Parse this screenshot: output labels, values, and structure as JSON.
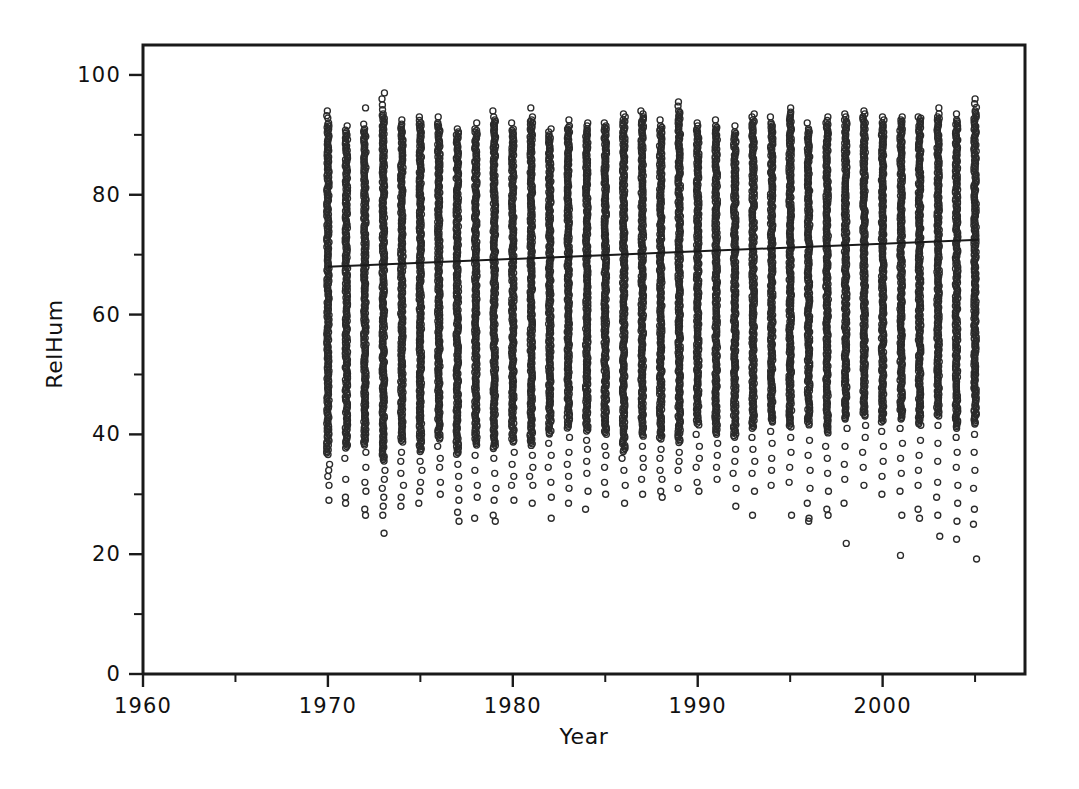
{
  "chart_data": {
    "type": "scatter",
    "title": "",
    "xlabel": "Year",
    "ylabel": "RelHum",
    "xlim": [
      1960,
      2007.7
    ],
    "ylim": [
      0,
      105
    ],
    "grid": false,
    "legend": "none",
    "x_ticks_major": [
      1960,
      1970,
      1980,
      1990,
      2000
    ],
    "x_tick_labels": [
      "1960",
      "1970",
      "1980",
      "1990",
      "2000"
    ],
    "x_ticks_minor": [
      1965,
      1975,
      1985,
      1995,
      2005
    ],
    "y_ticks_major": [
      0,
      20,
      40,
      60,
      80,
      100
    ],
    "y_tick_labels": [
      "0",
      "20",
      "40",
      "60",
      "80",
      "100"
    ],
    "y_ticks_minor": [
      10,
      30,
      50,
      70,
      90
    ],
    "marker_style": "open-circle",
    "marker_size_px": 6,
    "series": [
      {
        "name": "RelHum observations",
        "note": "Dense daily relative-humidity readings, one vertical column of points per year.",
        "columns": [
          {
            "x": 1970.0,
            "dense_min": 36.5,
            "dense_max": 92.0,
            "top_outliers": [
              94.0,
              93.2,
              92.8
            ],
            "bottom_outliers": [
              35.0,
              34.0,
              33.0,
              31.5,
              29.0
            ]
          },
          {
            "x": 1971.0,
            "dense_min": 37.5,
            "dense_max": 90.5,
            "top_outliers": [
              91.5,
              90.8
            ],
            "bottom_outliers": [
              36.0,
              32.5,
              29.5,
              28.5
            ]
          },
          {
            "x": 1972.0,
            "dense_min": 38.0,
            "dense_max": 91.0,
            "top_outliers": [
              94.5,
              91.8
            ],
            "bottom_outliers": [
              37.0,
              34.5,
              32.0,
              30.5,
              27.5,
              26.5
            ]
          },
          {
            "x": 1973.0,
            "dense_min": 35.5,
            "dense_max": 93.5,
            "top_outliers": [
              97.0,
              96.0,
              95.0,
              94.2
            ],
            "bottom_outliers": [
              34.0,
              32.5,
              31.0,
              29.5,
              28.0,
              26.5,
              23.5
            ]
          },
          {
            "x": 1974.0,
            "dense_min": 38.5,
            "dense_max": 91.5,
            "top_outliers": [
              92.5,
              91.8
            ],
            "bottom_outliers": [
              37.0,
              35.5,
              33.5,
              31.5,
              29.5,
              28.0
            ]
          },
          {
            "x": 1975.0,
            "dense_min": 37.0,
            "dense_max": 92.0,
            "top_outliers": [
              93.0,
              92.4
            ],
            "bottom_outliers": [
              35.5,
              34.0,
              32.0,
              30.5,
              28.5
            ]
          },
          {
            "x": 1976.0,
            "dense_min": 39.0,
            "dense_max": 92.0,
            "top_outliers": [
              93.0
            ],
            "bottom_outliers": [
              38.0,
              36.0,
              34.5,
              32.0,
              30.0
            ]
          },
          {
            "x": 1977.0,
            "dense_min": 36.5,
            "dense_max": 90.5,
            "top_outliers": [
              91.0
            ],
            "bottom_outliers": [
              35.0,
              33.0,
              31.0,
              29.0,
              27.0,
              25.5
            ]
          },
          {
            "x": 1978.0,
            "dense_min": 38.0,
            "dense_max": 91.0,
            "top_outliers": [
              92.0
            ],
            "bottom_outliers": [
              36.5,
              34.0,
              31.5,
              29.5,
              26.0
            ]
          },
          {
            "x": 1979.0,
            "dense_min": 37.5,
            "dense_max": 92.5,
            "top_outliers": [
              94.0,
              93.0
            ],
            "bottom_outliers": [
              36.0,
              33.5,
              31.0,
              29.0,
              26.5,
              25.5
            ]
          },
          {
            "x": 1980.0,
            "dense_min": 38.5,
            "dense_max": 91.0,
            "top_outliers": [
              92.0
            ],
            "bottom_outliers": [
              37.0,
              35.0,
              33.0,
              31.5,
              29.0
            ]
          },
          {
            "x": 1981.0,
            "dense_min": 38.0,
            "dense_max": 92.5,
            "top_outliers": [
              94.5,
              93.0
            ],
            "bottom_outliers": [
              36.5,
              34.5,
              33.0,
              31.5,
              28.5
            ]
          },
          {
            "x": 1982.0,
            "dense_min": 40.0,
            "dense_max": 90.0,
            "top_outliers": [
              91.0,
              90.5
            ],
            "bottom_outliers": [
              38.5,
              36.5,
              34.5,
              32.0,
              29.5,
              26.0
            ]
          },
          {
            "x": 1983.0,
            "dense_min": 41.0,
            "dense_max": 91.5,
            "top_outliers": [
              92.5
            ],
            "bottom_outliers": [
              39.5,
              37.0,
              35.0,
              33.0,
              31.0,
              28.5
            ]
          },
          {
            "x": 1984.0,
            "dense_min": 40.5,
            "dense_max": 91.0,
            "top_outliers": [
              92.0,
              91.5
            ],
            "bottom_outliers": [
              39.0,
              37.5,
              35.5,
              33.5,
              30.5,
              27.5
            ]
          },
          {
            "x": 1985.0,
            "dense_min": 40.0,
            "dense_max": 91.5,
            "top_outliers": [
              92.0
            ],
            "bottom_outliers": [
              38.0,
              36.5,
              34.5,
              32.0,
              30.0
            ]
          },
          {
            "x": 1986.0,
            "dense_min": 37.0,
            "dense_max": 92.5,
            "top_outliers": [
              93.5,
              93.0
            ],
            "bottom_outliers": [
              36.0,
              34.0,
              31.5,
              28.5
            ]
          },
          {
            "x": 1987.0,
            "dense_min": 39.5,
            "dense_max": 93.0,
            "top_outliers": [
              94.0,
              93.5
            ],
            "bottom_outliers": [
              38.0,
              36.0,
              34.5,
              32.5,
              30.0
            ]
          },
          {
            "x": 1988.0,
            "dense_min": 39.0,
            "dense_max": 91.5,
            "top_outliers": [
              92.5
            ],
            "bottom_outliers": [
              37.5,
              36.0,
              34.0,
              32.5,
              30.5,
              29.5
            ]
          },
          {
            "x": 1989.0,
            "dense_min": 38.5,
            "dense_max": 94.0,
            "top_outliers": [
              95.5,
              94.8
            ],
            "bottom_outliers": [
              37.0,
              35.5,
              34.0,
              31.0
            ]
          },
          {
            "x": 1990.0,
            "dense_min": 41.5,
            "dense_max": 91.0,
            "top_outliers": [
              92.0,
              91.5
            ],
            "bottom_outliers": [
              40.0,
              38.0,
              36.0,
              34.5,
              32.0,
              30.5
            ]
          },
          {
            "x": 1991.0,
            "dense_min": 40.0,
            "dense_max": 91.5,
            "top_outliers": [
              92.5
            ],
            "bottom_outliers": [
              48.0,
              43.0,
              38.5,
              36.5,
              34.5,
              32.5
            ]
          },
          {
            "x": 1992.0,
            "dense_min": 39.5,
            "dense_max": 90.5,
            "top_outliers": [
              91.5
            ],
            "bottom_outliers": [
              37.5,
              35.5,
              33.5,
              31.0,
              28.0
            ]
          },
          {
            "x": 1993.0,
            "dense_min": 41.0,
            "dense_max": 92.5,
            "top_outliers": [
              93.5,
              93.0
            ],
            "bottom_outliers": [
              39.5,
              37.5,
              35.5,
              33.5,
              30.5,
              26.5
            ]
          },
          {
            "x": 1994.0,
            "dense_min": 42.0,
            "dense_max": 92.0,
            "top_outliers": [
              93.0
            ],
            "bottom_outliers": [
              40.5,
              38.5,
              36.0,
              34.0,
              31.5
            ]
          },
          {
            "x": 1995.0,
            "dense_min": 41.0,
            "dense_max": 93.5,
            "top_outliers": [
              94.5,
              93.8
            ],
            "bottom_outliers": [
              52.0,
              44.0,
              39.5,
              37.0,
              34.5,
              32.0,
              26.5
            ]
          },
          {
            "x": 1996.0,
            "dense_min": 41.5,
            "dense_max": 91.0,
            "top_outliers": [
              92.0
            ],
            "bottom_outliers": [
              43.0,
              39.0,
              36.5,
              34.0,
              31.0,
              28.5,
              26.0,
              25.5
            ]
          },
          {
            "x": 1997.0,
            "dense_min": 40.0,
            "dense_max": 92.0,
            "top_outliers": [
              93.0,
              92.4
            ],
            "bottom_outliers": [
              38.0,
              36.0,
              33.5,
              30.5,
              27.5,
              26.5
            ]
          },
          {
            "x": 1998.0,
            "dense_min": 42.5,
            "dense_max": 92.5,
            "top_outliers": [
              93.5,
              93.0
            ],
            "bottom_outliers": [
              45.0,
              41.0,
              38.0,
              35.0,
              32.5,
              28.5,
              21.8
            ]
          },
          {
            "x": 1999.0,
            "dense_min": 43.0,
            "dense_max": 93.0,
            "top_outliers": [
              94.0,
              93.5
            ],
            "bottom_outliers": [
              41.5,
              39.5,
              37.0,
              34.5,
              31.5
            ]
          },
          {
            "x": 2000.0,
            "dense_min": 42.0,
            "dense_max": 92.0,
            "top_outliers": [
              93.0,
              92.5
            ],
            "bottom_outliers": [
              43.5,
              40.5,
              38.0,
              35.5,
              33.0,
              30.0
            ]
          },
          {
            "x": 2001.0,
            "dense_min": 42.5,
            "dense_max": 92.5,
            "top_outliers": [
              93.0
            ],
            "bottom_outliers": [
              44.0,
              41.0,
              38.5,
              36.0,
              33.5,
              30.5,
              26.5,
              19.8
            ]
          },
          {
            "x": 2002.0,
            "dense_min": 41.5,
            "dense_max": 92.5,
            "top_outliers": [
              93.0,
              92.8
            ],
            "bottom_outliers": [
              45.5,
              42.5,
              39.0,
              36.5,
              34.0,
              31.5,
              27.5,
              26.0
            ]
          },
          {
            "x": 2003.0,
            "dense_min": 43.0,
            "dense_max": 93.0,
            "top_outliers": [
              94.5,
              93.5
            ],
            "bottom_outliers": [
              50.5,
              44.5,
              41.5,
              38.5,
              35.5,
              32.0,
              29.5,
              26.5,
              23.0
            ]
          },
          {
            "x": 2004.0,
            "dense_min": 41.0,
            "dense_max": 92.5,
            "top_outliers": [
              93.5
            ],
            "bottom_outliers": [
              42.5,
              39.5,
              37.0,
              34.5,
              31.5,
              28.5,
              25.5,
              22.5
            ]
          },
          {
            "x": 2005.0,
            "dense_min": 41.5,
            "dense_max": 94.0,
            "top_outliers": [
              96.0,
              95.2,
              94.6
            ],
            "bottom_outliers": [
              47.5,
              43.5,
              40.0,
              37.0,
              34.0,
              31.0,
              27.5,
              25.0,
              19.2
            ]
          }
        ]
      }
    ],
    "trendline": {
      "name": "linear fit",
      "x_start": 1970.0,
      "y_start": 68.0,
      "x_end": 2005.2,
      "y_end": 72.5
    }
  },
  "axes": {
    "x_title": "Year",
    "y_title": "RelHum"
  },
  "colors": {
    "frame": "#1a1a1a",
    "marker": "#2b2b2b",
    "trend": "#1a1a1a",
    "background": "#ffffff",
    "text": "#111111"
  }
}
